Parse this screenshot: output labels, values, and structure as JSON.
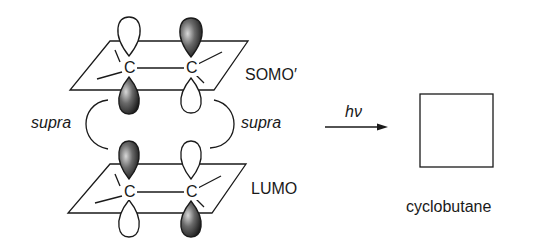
{
  "diagram": {
    "top_orbital_label": "SOMO′",
    "bottom_orbital_label": "LUMO",
    "atom_label": "C",
    "left_interaction": "supra",
    "right_interaction": "supra",
    "arrow_label": "hν",
    "product_label": "cyclobutane",
    "colors": {
      "line": "#1a1a1a",
      "shaded_lobe": "#3a3a3a",
      "background": "#ffffff"
    }
  }
}
